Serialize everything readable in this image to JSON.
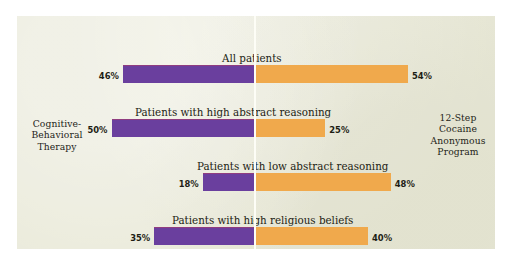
{
  "figure": {
    "background_color": "#e9e9d8",
    "outer_color": "#ffffff",
    "left_caption": "Cognitive-\nBehavioral\nTherapy",
    "right_caption": "12-Step\nCocaine\nAnonymous\nProgram"
  },
  "chart_data": {
    "type": "bar",
    "title": "",
    "subtitle": "",
    "orientation": "horizontal",
    "style": "diverging-bidirectional",
    "xlabel": "",
    "ylabel": "",
    "grid": false,
    "legend_position": "axis-ends",
    "axis_center_label": "0%",
    "xlim": [
      -55,
      55
    ],
    "categories": [
      "All patients",
      "Patients with high abstract reasoning",
      "Patients with low abstract reasoning",
      "Patients with high religious beliefs"
    ],
    "series": [
      {
        "name": "Cognitive-Behavioral Therapy",
        "direction": "left",
        "color": "#6a3f9e",
        "values": [
          46,
          50,
          18,
          35
        ],
        "value_labels": [
          "46%",
          "50%",
          "18%",
          "35%"
        ]
      },
      {
        "name": "12-Step Cocaine Anonymous Program",
        "direction": "right",
        "color": "#f0a94c",
        "values": [
          54,
          25,
          48,
          40
        ],
        "value_labels": [
          "54%",
          "25%",
          "48%",
          "40%"
        ]
      }
    ]
  }
}
